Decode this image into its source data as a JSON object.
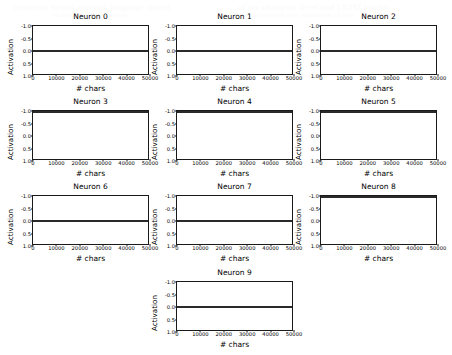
{
  "figure": {
    "background_color": "#ffffff",
    "line_color": "#2a2a2a",
    "axis_color": "#1a1a1a",
    "grid_columns": 3,
    "grid_rows": 4
  },
  "axis_labels": {
    "x": "# chars",
    "y": "Activation"
  },
  "ticks": {
    "x": [
      "0",
      "10000",
      "20000",
      "30000",
      "40000",
      "50000"
    ],
    "y": [
      "1.0",
      "0.5",
      "0.0",
      "-0.5",
      "-1.0"
    ]
  },
  "ghost_text": [
    {
      "text": "recurrent neural network language model",
      "x": 14,
      "y": 2,
      "size": 9
    },
    {
      "text": "of the character level and LSTM hidden",
      "x": 238,
      "y": 2,
      "size": 9
    },
    {
      "text": "characterize the behavior",
      "x": 52,
      "y": 11,
      "size": 7
    },
    {
      "text": "activations over sequences of text",
      "x": 252,
      "y": 11,
      "size": 7
    },
    {
      "text": "individual cells",
      "x": 170,
      "y": 196,
      "size": 8
    },
    {
      "text": "saturated units",
      "x": 330,
      "y": 206,
      "size": 8
    },
    {
      "text": "in the model",
      "x": 336,
      "y": 216,
      "size": 8
    },
    {
      "text": "over time",
      "x": 318,
      "y": 250,
      "size": 7
    },
    {
      "text": "firing patterns",
      "x": 40,
      "y": 196,
      "size": 7
    }
  ],
  "chart_data": {
    "type": "line",
    "title": "",
    "xlabel": "# chars",
    "ylabel": "Activation",
    "xlim": [
      0,
      50000
    ],
    "ylim": [
      -1.0,
      1.0
    ],
    "xticks": [
      0,
      10000,
      20000,
      30000,
      40000,
      50000
    ],
    "yticks": [
      -1.0,
      -0.5,
      0.0,
      0.5,
      1.0
    ],
    "grid": false,
    "legend": "none",
    "panels": [
      {
        "title": "Neuron 0",
        "row": 0,
        "col": 0,
        "series": [
          {
            "name": "activation",
            "constant_value": 0.0,
            "x": [
              0,
              50000
            ],
            "values": [
              0.0,
              0.0
            ]
          }
        ]
      },
      {
        "title": "Neuron 1",
        "row": 0,
        "col": 1,
        "series": [
          {
            "name": "activation",
            "constant_value": 0.0,
            "x": [
              0,
              50000
            ],
            "values": [
              0.0,
              0.0
            ]
          }
        ]
      },
      {
        "title": "Neuron 2",
        "row": 0,
        "col": 2,
        "series": [
          {
            "name": "activation",
            "constant_value": 0.0,
            "x": [
              0,
              50000
            ],
            "values": [
              0.0,
              0.0
            ]
          }
        ]
      },
      {
        "title": "Neuron 3",
        "row": 1,
        "col": 0,
        "series": [
          {
            "name": "activation",
            "constant_value": 1.0,
            "x": [
              0,
              50000
            ],
            "values": [
              1.0,
              1.0
            ]
          }
        ]
      },
      {
        "title": "Neuron 4",
        "row": 1,
        "col": 1,
        "series": [
          {
            "name": "activation",
            "constant_value": 1.0,
            "x": [
              0,
              50000
            ],
            "values": [
              1.0,
              1.0
            ]
          }
        ]
      },
      {
        "title": "Neuron 5",
        "row": 1,
        "col": 2,
        "series": [
          {
            "name": "activation",
            "constant_value": 1.0,
            "x": [
              0,
              50000
            ],
            "values": [
              1.0,
              1.0
            ]
          }
        ]
      },
      {
        "title": "Neuron 6",
        "row": 2,
        "col": 0,
        "series": [
          {
            "name": "activation",
            "constant_value": 0.0,
            "x": [
              0,
              50000
            ],
            "values": [
              0.0,
              0.0
            ]
          }
        ]
      },
      {
        "title": "Neuron 7",
        "row": 2,
        "col": 1,
        "series": [
          {
            "name": "activation",
            "constant_value": 0.0,
            "x": [
              0,
              50000
            ],
            "values": [
              0.0,
              0.0
            ]
          }
        ]
      },
      {
        "title": "Neuron 8",
        "row": 2,
        "col": 2,
        "series": [
          {
            "name": "activation",
            "constant_value": 1.0,
            "x": [
              0,
              50000
            ],
            "values": [
              1.0,
              1.0
            ]
          }
        ]
      },
      {
        "title": "Neuron 9",
        "row": 3,
        "col": 1,
        "series": [
          {
            "name": "activation",
            "constant_value": 0.0,
            "x": [
              0,
              50000
            ],
            "values": [
              0.0,
              0.0
            ]
          }
        ]
      }
    ]
  }
}
